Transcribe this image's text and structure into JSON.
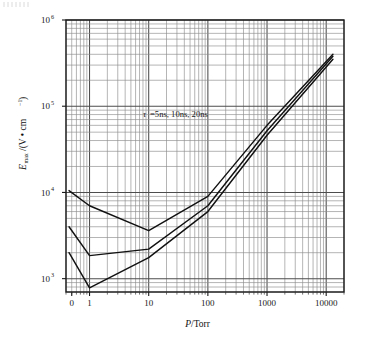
{
  "figure": {
    "background": "#ffffff",
    "frame_color": "#1a1a1a",
    "grid_major_color": "#4d4d4d",
    "grid_minor_color": "#8c8c8c",
    "curve_color": "#111111"
  },
  "annotation": {
    "tau_symbol": "τ",
    "text": " =5ns, 10ns, 20ns",
    "full": "τ =5ns, 10ns, 20ns"
  },
  "axes": {
    "x": {
      "title_italic": "P",
      "title_rest": "/Torr",
      "title": "P/Torr",
      "ticks": [
        "0",
        "1",
        "10",
        "100",
        "1000",
        "10000"
      ],
      "scale": "log",
      "minor_grid": true
    },
    "y": {
      "title_main": "E",
      "title_sub": "max",
      "title_rest": "/(V • cm",
      "title_sup": "−1",
      "title_end": ")",
      "title": "Emax/(V • cm⁻¹)",
      "ticks": [
        "10³",
        "10⁴",
        "10⁵",
        "10⁶"
      ],
      "tick_bases": [
        "10",
        "10",
        "10",
        "10"
      ],
      "tick_exponents": [
        "3",
        "4",
        "5",
        "6"
      ],
      "scale": "log",
      "minor_grid": true
    }
  },
  "chart_data": {
    "type": "line",
    "title": "",
    "xlabel": "P/Torr",
    "ylabel": "Emax/(V • cm⁻¹)",
    "xscale": "log",
    "yscale": "log",
    "xlim": [
      0.4,
      20000
    ],
    "ylim": [
      700,
      1000000
    ],
    "grid": true,
    "legend": "inline-annotation",
    "legend_position": "upper-left-inside",
    "xticks": [
      0,
      1,
      10,
      100,
      1000,
      10000
    ],
    "yticks": [
      1000,
      10000,
      100000,
      1000000
    ],
    "series": [
      {
        "name": "τ = 20ns",
        "x": [
          0.45,
          1.0,
          10.0,
          100.0,
          1000.0,
          13000.0
        ],
        "y": [
          10500,
          7000,
          3600,
          9000,
          60000,
          400000
        ]
      },
      {
        "name": "τ = 10ns",
        "x": [
          0.45,
          1.0,
          10.0,
          100.0,
          1000.0,
          13000.0
        ],
        "y": [
          4000,
          1850,
          2200,
          7000,
          52000,
          380000
        ]
      },
      {
        "name": "τ = 5ns",
        "x": [
          0.45,
          1.0,
          10.0,
          100.0,
          1000.0,
          13000.0
        ],
        "y": [
          2000,
          780,
          1750,
          6000,
          46000,
          350000
        ]
      }
    ]
  }
}
